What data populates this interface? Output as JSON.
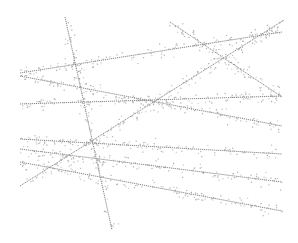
{
  "figure": {
    "width": 298,
    "height": 243,
    "background": "#ffffff",
    "stroke_color": "#7a7a7a",
    "point_color": "#9a9a9a"
  },
  "lines": [
    {
      "id": "steep",
      "x1": 65,
      "y1": 17,
      "x2": 112,
      "y2": 230,
      "n": 60
    },
    {
      "id": "upper-rising",
      "x1": 20,
      "y1": 73,
      "x2": 282,
      "y2": 32,
      "n": 80
    },
    {
      "id": "top-falling",
      "x1": 170,
      "y1": 22,
      "x2": 282,
      "y2": 97,
      "n": 50
    },
    {
      "id": "long-rising",
      "x1": 20,
      "y1": 186,
      "x2": 284,
      "y2": 20,
      "n": 90
    },
    {
      "id": "mid-falling",
      "x1": 20,
      "y1": 76,
      "x2": 282,
      "y2": 126,
      "n": 80
    },
    {
      "id": "mid-flat",
      "x1": 20,
      "y1": 104,
      "x2": 282,
      "y2": 96,
      "n": 80
    },
    {
      "id": "low-1",
      "x1": 20,
      "y1": 139,
      "x2": 282,
      "y2": 154,
      "n": 80
    },
    {
      "id": "low-2",
      "x1": 20,
      "y1": 149,
      "x2": 282,
      "y2": 182,
      "n": 80
    },
    {
      "id": "low-3",
      "x1": 20,
      "y1": 162,
      "x2": 282,
      "y2": 211,
      "n": 80
    }
  ]
}
